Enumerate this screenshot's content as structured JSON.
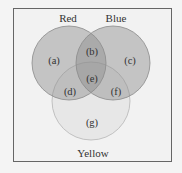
{
  "diagram": {
    "type": "venn-3",
    "sets": [
      {
        "name": "Red",
        "cx": 69,
        "cy": 63,
        "r": 37,
        "fill": "#9a9a9a",
        "opacity": 0.5
      },
      {
        "name": "Blue",
        "cx": 113,
        "cy": 63,
        "r": 37,
        "fill": "#9a9a9a",
        "opacity": 0.5
      },
      {
        "name": "Yellow",
        "cx": 91,
        "cy": 101,
        "r": 39,
        "fill": "#e2e2e2",
        "opacity": 0.6
      }
    ],
    "set_labels": {
      "red": "Red",
      "blue": "Blue",
      "yellow": "Yellow"
    },
    "regions": {
      "a": "(a)",
      "b": "(b)",
      "c": "(c)",
      "d": "(d)",
      "e": "(e)",
      "f": "(f)",
      "g": "(g)"
    },
    "colors": {
      "background": "#f4f4f4",
      "frame_border": "#666666",
      "circle_stroke": "#8a8a8a",
      "text": "#333333"
    }
  }
}
